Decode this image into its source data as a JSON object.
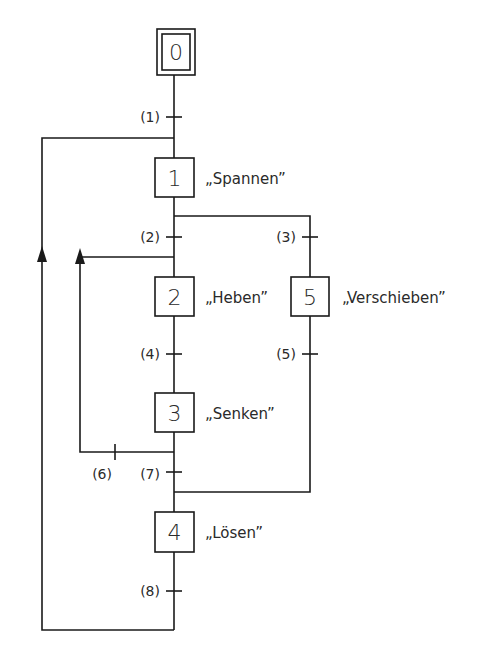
{
  "diagram": {
    "type": "GRAFCET / sequential function chart",
    "steps": [
      {
        "id": "0",
        "label": "",
        "initial": true
      },
      {
        "id": "1",
        "label": "„Spannen”"
      },
      {
        "id": "2",
        "label": "„Heben”"
      },
      {
        "id": "5",
        "label": "„Verschieben”"
      },
      {
        "id": "3",
        "label": "„Senken”"
      },
      {
        "id": "4",
        "label": "„Lösen”"
      }
    ],
    "transitions": [
      {
        "id": "(1)",
        "from": "0",
        "to": "1"
      },
      {
        "id": "(2)",
        "from": "1",
        "to": "2"
      },
      {
        "id": "(3)",
        "from": "1",
        "to": "5"
      },
      {
        "id": "(4)",
        "from": "2",
        "to": "3"
      },
      {
        "id": "(5)",
        "from": "5",
        "to": "4"
      },
      {
        "id": "(6)",
        "from": "3",
        "to": "2"
      },
      {
        "id": "(7)",
        "from": "3",
        "to": "4"
      },
      {
        "id": "(8)",
        "from": "4",
        "to": "1"
      }
    ],
    "colors": {
      "line": "#1a1a1a",
      "text": "#2a2a2a",
      "background": "#ffffff"
    }
  }
}
